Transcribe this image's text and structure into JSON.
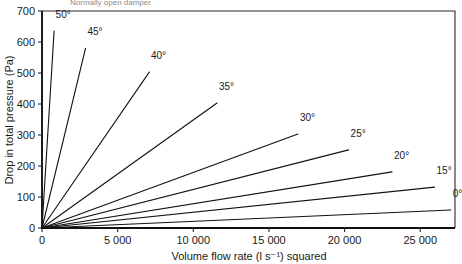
{
  "figure": {
    "caption_partial": "Normally open damper",
    "background": "#ffffff",
    "line_color": "#111111"
  },
  "chart_data": {
    "type": "line",
    "title": "",
    "xlabel": "Volume flow rate (l s⁻¹) squared",
    "ylabel": "Drop in total pressure (Pa)",
    "xlim": [
      0,
      27300
    ],
    "ylim": [
      0,
      700
    ],
    "grid": false,
    "legend_position": "inline-end-of-line",
    "xticks": [
      0,
      5000,
      10000,
      15000,
      20000,
      25000
    ],
    "xtick_labels": [
      "0",
      "5 000",
      "10 000",
      "15 000",
      "20 000",
      "25 000"
    ],
    "yticks": [
      0,
      100,
      200,
      300,
      400,
      500,
      600,
      700
    ],
    "ytick_labels": [
      "0",
      "100",
      "200",
      "300",
      "400",
      "500",
      "600",
      "700"
    ],
    "series": [
      {
        "name": "50°",
        "label": "50°",
        "slope": 0.794,
        "x": [
          0,
          800
        ],
        "y": [
          0,
          635
        ],
        "label_x": 900,
        "label_y": 690
      },
      {
        "name": "45°",
        "label": "45°",
        "slope": 0.2014,
        "x": [
          0,
          2880
        ],
        "y": [
          0,
          580
        ],
        "label_x": 3000,
        "label_y": 636
      },
      {
        "name": "40°",
        "label": "40°",
        "slope": 0.0709,
        "x": [
          0,
          7090
        ],
        "y": [
          0,
          503
        ],
        "label_x": 7200,
        "label_y": 558
      },
      {
        "name": "35°",
        "label": "35°",
        "slope": 0.0348,
        "x": [
          0,
          11570
        ],
        "y": [
          0,
          403
        ],
        "label_x": 11700,
        "label_y": 458
      },
      {
        "name": "30°",
        "label": "30°",
        "slope": 0.0179,
        "x": [
          0,
          16920
        ],
        "y": [
          0,
          303
        ],
        "label_x": 17050,
        "label_y": 358
      },
      {
        "name": "25°",
        "label": "25°",
        "slope": 0.01243,
        "x": [
          0,
          20270
        ],
        "y": [
          0,
          252
        ],
        "label_x": 20400,
        "label_y": 306
      },
      {
        "name": "20°",
        "label": "20°",
        "slope": 0.00782,
        "x": [
          0,
          23140
        ],
        "y": [
          0,
          181
        ],
        "label_x": 23270,
        "label_y": 236
      },
      {
        "name": "15°",
        "label": "15°",
        "slope": 0.00509,
        "x": [
          0,
          25950
        ],
        "y": [
          0,
          132
        ],
        "label_x": 26080,
        "label_y": 186
      },
      {
        "name": "0°",
        "label": "0°",
        "slope": 0.00215,
        "x": [
          0,
          27020
        ],
        "y": [
          0,
          58
        ],
        "label_x": 27150,
        "label_y": 112
      }
    ]
  }
}
